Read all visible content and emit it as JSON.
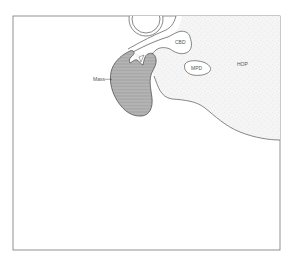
{
  "figure": {
    "type": "anatomical line diagram",
    "labels": {
      "mass": "Mass",
      "cbd": "CBD",
      "mpd": "MPD",
      "hop": "HOP"
    },
    "colors": {
      "outline": "#444444",
      "frame": "#777777",
      "mass_fill": "#a8a8a8",
      "mass_hatch": "#cfcfcf",
      "stipple_bg": "#f4f4f4",
      "stipple_dot": "#c8c8c8",
      "label_text": "#555555"
    }
  }
}
